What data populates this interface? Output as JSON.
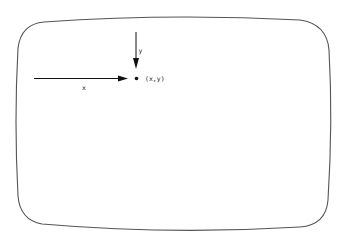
{
  "diagram": {
    "title": "",
    "screen_frame": {
      "shape": "rounded-crt-screen",
      "stroke": "#555555"
    },
    "x_arrow": {
      "label": "x",
      "direction": "right",
      "from": [
        34,
        78
      ],
      "to": [
        128,
        78
      ]
    },
    "y_arrow": {
      "label": "y",
      "direction": "down",
      "from": [
        136,
        32
      ],
      "to": [
        136,
        69
      ]
    },
    "point": {
      "label": "(x,y)",
      "position": [
        136,
        78
      ]
    },
    "colors": {
      "ink": "#111111",
      "frame": "#555555",
      "background": "#ffffff"
    }
  }
}
